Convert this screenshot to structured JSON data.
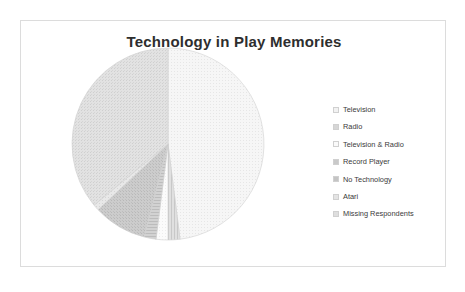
{
  "chart_data": {
    "type": "pie",
    "title": "Technology in Play Memories",
    "xlabel": "",
    "ylabel": "",
    "legend_position": "right",
    "grid": false,
    "categories": [
      "Television",
      "Radio",
      "Television & Radio",
      "Record Player",
      "No Technology",
      "Atari",
      "Missing Respondents"
    ],
    "values": [
      48,
      2,
      2,
      2,
      9,
      1,
      36
    ],
    "units": "percent",
    "slice_angles_deg": [
      {
        "label": "Television",
        "start": 0,
        "end": 172.8
      },
      {
        "label": "Radio",
        "start": 172.8,
        "end": 180.0
      },
      {
        "label": "Television & Radio",
        "start": 180.0,
        "end": 187.2
      },
      {
        "label": "Record Player",
        "start": 187.2,
        "end": 194.4
      },
      {
        "label": "No Technology",
        "start": 194.4,
        "end": 226.8
      },
      {
        "label": "Atari",
        "start": 226.8,
        "end": 230.4
      },
      {
        "label": "Missing Respondents",
        "start": 230.4,
        "end": 360.0
      }
    ],
    "slice_colors": [
      "#f2f2f2",
      "#d6d6d6",
      "#fafafa",
      "#c9c9c9",
      "#c4c4c4",
      "#e4e4e4",
      "#dedede"
    ],
    "slice_edge_color": "#d0d0d0",
    "data_labels_shown": false
  },
  "legend": {
    "items": [
      {
        "label": "Television",
        "color": "#f2f2f2"
      },
      {
        "label": "Radio",
        "color": "#d6d6d6"
      },
      {
        "label": "Television & Radio",
        "color": "#fafafa"
      },
      {
        "label": "Record Player",
        "color": "#c9c9c9"
      },
      {
        "label": "No Technology",
        "color": "#c4c4c4"
      },
      {
        "label": "Atari",
        "color": "#e4e4e4"
      },
      {
        "label": "Missing Respondents",
        "color": "#dedede"
      }
    ]
  },
  "frame": {
    "border_color": "#dcdcdc",
    "background": "#ffffff"
  }
}
